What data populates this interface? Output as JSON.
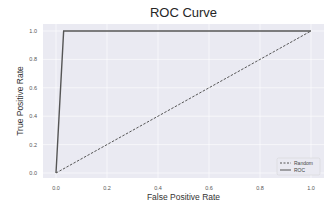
{
  "chart_data": {
    "type": "line",
    "title": "ROC Curve",
    "xlabel": "False Positive Rate",
    "ylabel": "True Positive Rate",
    "xlim": [
      0.0,
      1.0
    ],
    "ylim": [
      0.0,
      1.0
    ],
    "xticks": [
      "0.0",
      "0.2",
      "0.4",
      "0.6",
      "0.8",
      "1.0"
    ],
    "yticks": [
      "0.0",
      "0.2",
      "0.4",
      "0.6",
      "0.8",
      "1.0"
    ],
    "grid": true,
    "legend_position": "lower right",
    "series": [
      {
        "name": "Random",
        "style": "dashed",
        "color": "#555555",
        "x": [
          0.0,
          1.0
        ],
        "y": [
          0.0,
          1.0
        ]
      },
      {
        "name": "ROC",
        "style": "solid",
        "color": "#555555",
        "x": [
          0.0,
          0.03,
          1.0
        ],
        "y": [
          0.0,
          1.0,
          1.0
        ]
      }
    ]
  },
  "colors": {
    "plot_background": "#eaeaf2",
    "grid": "#ffffff",
    "line": "#555555"
  }
}
